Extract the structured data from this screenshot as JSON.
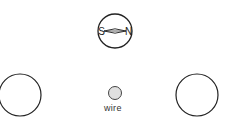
{
  "diagram": {
    "compass": {
      "south_label": "S",
      "north_label": "N",
      "needle_orientation": "horizontal"
    },
    "wire": {
      "label": "wire",
      "fill_color": "#e0e0e0"
    },
    "circles": [
      {
        "position": "left"
      },
      {
        "position": "right"
      }
    ],
    "stroke_color": "#222222"
  }
}
